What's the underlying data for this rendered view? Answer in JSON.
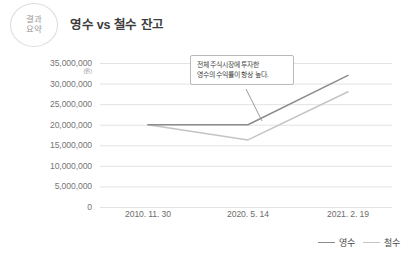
{
  "header": {
    "badge_line1": "결과",
    "badge_line2": "요약",
    "title": "영수 vs 철수 잔고"
  },
  "annotation": {
    "line1": "전체 주식시장에 투자한",
    "line2": "영수의 수익률이 항상 높다."
  },
  "legend": {
    "items": [
      {
        "label": "영수",
        "color": "#8c8c8c"
      },
      {
        "label": "철수",
        "color": "#c4c4c4"
      }
    ]
  },
  "axis": {
    "y_unit": "(원)",
    "y_ticks": [
      "35,000,000",
      "30,000,000",
      "25,000,000",
      "20,000,000",
      "15,000,000",
      "10,000,000",
      "5,000,000",
      "0"
    ],
    "x_ticks": [
      "2010. 11. 30",
      "2020. 5. 14",
      "2021. 2. 19"
    ]
  },
  "chart_data": {
    "type": "line",
    "title": "영수 vs 철수 잔고",
    "xlabel": "",
    "ylabel": "(원)",
    "x": [
      "2010. 11. 30",
      "2020. 5. 14",
      "2021. 2. 19"
    ],
    "ylim": [
      0,
      35000000
    ],
    "ytick_step": 5000000,
    "grid": true,
    "legend_position": "bottom-right",
    "series": [
      {
        "name": "영수",
        "color": "#8c8c8c",
        "values": [
          20000000,
          20000000,
          32000000
        ]
      },
      {
        "name": "철수",
        "color": "#c4c4c4",
        "values": [
          20000000,
          16300000,
          28000000
        ]
      }
    ],
    "annotations": [
      {
        "text": "전체 주식시장에 투자한 영수의 수익률이 항상 높다.",
        "points_to": "영수 line between 2020. 5. 14 and 2021. 2. 19"
      }
    ]
  }
}
